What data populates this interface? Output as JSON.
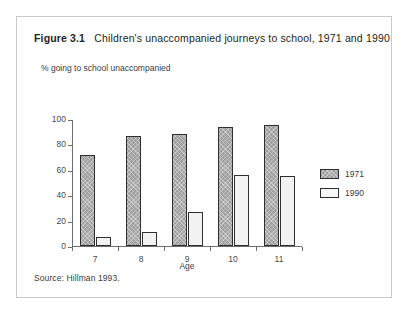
{
  "figure": {
    "label": "Figure 3.1",
    "caption": "Children's unaccompanied journeys to school, 1971 and 1990",
    "source": "Source: Hillman 1993."
  },
  "chart_data": {
    "type": "bar",
    "title": "Children's unaccompanied journeys to school, 1971 and 1990",
    "categories": [
      "7",
      "8",
      "9",
      "10",
      "11"
    ],
    "series": [
      {
        "name": "1971",
        "values": [
          72,
          87,
          88,
          94,
          95
        ],
        "color": "#9d9d9d"
      },
      {
        "name": "1990",
        "values": [
          7,
          11,
          27,
          56,
          55
        ],
        "color": "#f2f2f2"
      }
    ],
    "xlabel": "Age",
    "ylabel": "% going to school unaccompanied",
    "ylim": [
      0,
      100
    ],
    "yticks": [
      0,
      20,
      40,
      60,
      80,
      100
    ],
    "grid": false,
    "legend_position": "right"
  }
}
